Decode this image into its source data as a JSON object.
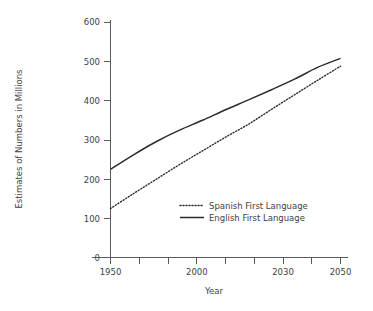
{
  "chart_data": {
    "type": "line",
    "title": "",
    "xlabel": "Year",
    "ylabel": "Estimates of Numbers in Millions",
    "xlim": [
      1950,
      2050
    ],
    "ylim": [
      0,
      600
    ],
    "grid": false,
    "legend_position": "inside-lower-right",
    "x_tick_labels": [
      "1950",
      "2000",
      "2030",
      "2050"
    ],
    "x_tick_values": [
      1950,
      2000,
      2030,
      2050
    ],
    "x_minor_tick_values": [
      1975,
      1990,
      2015,
      2040
    ],
    "y_tick_labels": [
      "0",
      "100",
      "200",
      "300",
      "400",
      "500",
      "600"
    ],
    "y_tick_values": [
      0,
      100,
      200,
      300,
      400,
      500,
      600
    ],
    "x": [
      1950,
      1960,
      1970,
      1980,
      1990,
      2000,
      2010,
      2020,
      2030,
      2040,
      2050
    ],
    "series": [
      {
        "name": "English First Language",
        "style": "solid",
        "color": "#2b2b2b",
        "values": [
          225,
          262,
          296,
          325,
          350,
          377,
          402,
          428,
          455,
          485,
          508
        ]
      },
      {
        "name": "Spanish First Language",
        "style": "dotted",
        "color": "#2b2b2b",
        "values": [
          125,
          163,
          200,
          237,
          272,
          307,
          340,
          378,
          415,
          452,
          488
        ]
      }
    ],
    "legend": [
      {
        "label": "Spanish First Language",
        "style": "dotted"
      },
      {
        "label": "English First Language",
        "style": "solid"
      }
    ]
  }
}
